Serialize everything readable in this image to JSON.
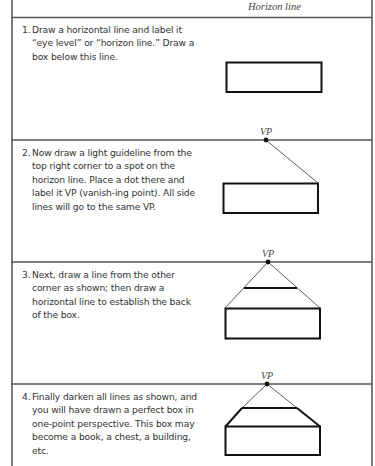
{
  "header": {
    "horizon_label": "Horizon line"
  },
  "steps": [
    {
      "number": "1.",
      "text": "Draw a horizontal line and label it “eye level” or “horizon line.” Draw a box below this line."
    },
    {
      "number": "2.",
      "text": "Now draw a light guideline from the top right corner to a spot on the horizon line. Place a dot there and label it VP (vanish-ing point). All side lines will go to the same VP.",
      "vp_label": "VP"
    },
    {
      "number": "3.",
      "text": "Next, draw a line from the other corner as shown; then draw a horizontal line to establish the back of the box.",
      "vp_label": "VP"
    },
    {
      "number": "4.",
      "text": "Finally darken all lines as shown, and you will have drawn a perfect box in one-point perspective. This box may become a book, a chest, a building, etc.",
      "vp_label": "VP"
    }
  ],
  "colors": {
    "line": "#111111",
    "horizon": "#555555",
    "border": "#7a7a7a",
    "text": "#333333"
  }
}
